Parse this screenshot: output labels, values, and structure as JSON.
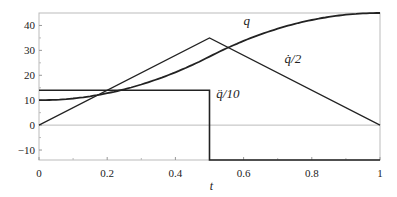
{
  "chart_data": {
    "type": "line",
    "title": "",
    "xlabel": "t",
    "ylabel": "",
    "xlim": [
      0,
      1
    ],
    "ylim": [
      -14,
      45
    ],
    "grid": false,
    "legend": "none (inline curve labels)",
    "x_ticks": [
      "0",
      "0.2",
      "0.4",
      "0.6",
      "0.8",
      "1"
    ],
    "y_ticks": [
      "-10",
      "0",
      "10",
      "20",
      "30",
      "40"
    ],
    "series": [
      {
        "name": "q",
        "label": "q",
        "x": [
          0,
          0.1,
          0.2,
          0.3,
          0.4,
          0.5,
          0.6,
          0.7,
          0.8,
          0.9,
          1.0
        ],
        "values": [
          10,
          10.7,
          12.8,
          16.3,
          21.2,
          27.5,
          33.8,
          38.7,
          42.2,
          44.3,
          45
        ]
      },
      {
        "name": "q_dot_over_2",
        "label": "q̇/2",
        "x": [
          0,
          0.5,
          1.0
        ],
        "values": [
          0,
          35,
          0
        ]
      },
      {
        "name": "q_ddot_over_10",
        "label": "q̈/10",
        "x": [
          0,
          0.5,
          0.5,
          1.0
        ],
        "values": [
          14,
          14,
          -14,
          -14
        ]
      }
    ],
    "annotations": [
      {
        "text": "q",
        "x": 0.6,
        "y": 40
      },
      {
        "text": "q̇/2",
        "x": 0.72,
        "y": 25
      },
      {
        "text": "q̈/10",
        "x": 0.52,
        "y": 11
      }
    ]
  }
}
